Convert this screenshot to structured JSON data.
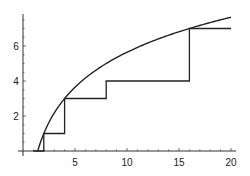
{
  "chart_data": {
    "type": "line",
    "title": "",
    "xlabel": "",
    "ylabel": "",
    "xlim": [
      0,
      20.3
    ],
    "ylim": [
      0,
      7.7
    ],
    "grid": false,
    "x_ticks": [
      5,
      10,
      15,
      20
    ],
    "y_ticks": [
      2,
      4,
      6
    ],
    "x_tick_labels": [
      "5",
      "10",
      "15",
      "20"
    ],
    "y_tick_labels": [
      "2",
      "4",
      "6"
    ],
    "series": [
      {
        "name": "smooth curve",
        "kind": "curve",
        "formula": "2*log2(x) - 1",
        "x": [
          1.414,
          2,
          3,
          4,
          6,
          8,
          10,
          12,
          14,
          16,
          18,
          20
        ],
        "values": [
          0,
          1,
          2.17,
          3,
          4.17,
          5,
          5.64,
          6.17,
          6.61,
          7,
          7.34,
          7.64
        ]
      },
      {
        "name": "step function",
        "kind": "step",
        "x": [
          1,
          2,
          2,
          4,
          4,
          8,
          8,
          16,
          16,
          20
        ],
        "values": [
          0,
          0,
          1,
          1,
          3,
          3,
          4,
          4,
          7,
          7
        ]
      }
    ],
    "colors": {
      "line": "#222222",
      "axis": "#333333",
      "background": "#ffffff"
    }
  }
}
